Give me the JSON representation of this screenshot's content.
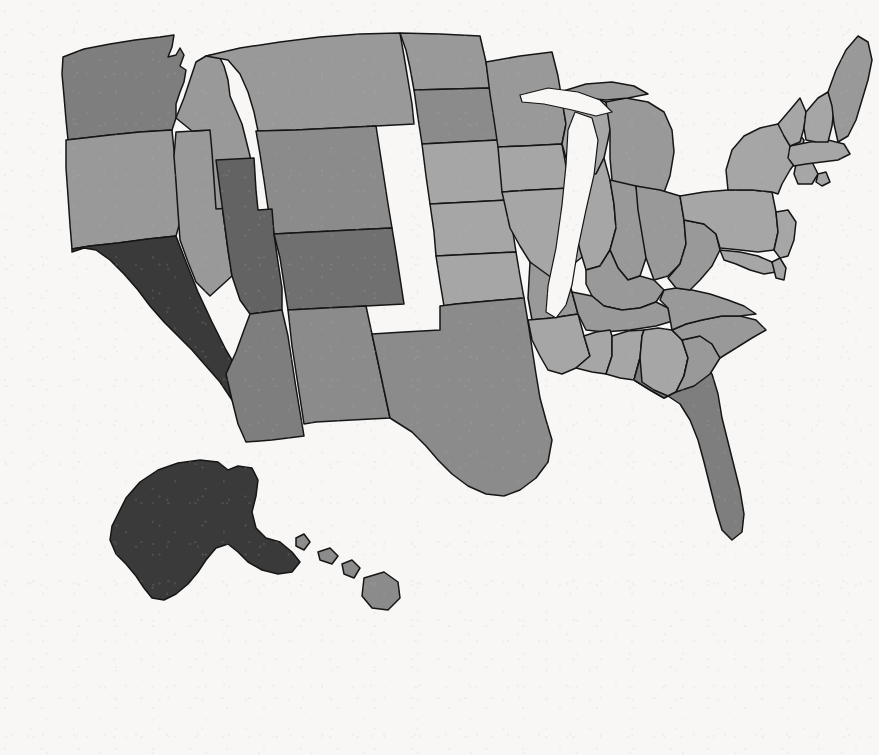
{
  "figure": {
    "type": "choropleth-map",
    "region": "United States",
    "background_color": "#f8f7f5",
    "border_color": "#151515"
  },
  "legend": {
    "label": "Number of national parks",
    "orientation": "horizontal",
    "tick_values": [
      "0",
      "2",
      "4",
      "6",
      "8"
    ],
    "vmin": 0,
    "vmax": 8,
    "color_low": "#a6a6a6",
    "color_high": "#3a3a3a",
    "colormap": "grayscale-sequential"
  },
  "chart_data": {
    "type": "heatmap",
    "title": "",
    "xlabel": "",
    "ylabel": "",
    "legend_title": "Number of national parks",
    "legend_position": "bottom-left",
    "grid": false,
    "value_range": [
      0,
      8
    ],
    "colormap_low": "#a6a6a6",
    "colormap_high": "#3a3a3a",
    "categories": [
      "Alabama",
      "Alaska",
      "Arizona",
      "Arkansas",
      "California",
      "Colorado",
      "Connecticut",
      "Delaware",
      "Florida",
      "Georgia",
      "Hawaii",
      "Idaho",
      "Illinois",
      "Indiana",
      "Iowa",
      "Kansas",
      "Kentucky",
      "Louisiana",
      "Maine",
      "Maryland",
      "Massachusetts",
      "Michigan",
      "Minnesota",
      "Mississippi",
      "Missouri",
      "Montana",
      "Nebraska",
      "Nevada",
      "New Hampshire",
      "New Jersey",
      "New Mexico",
      "New York",
      "North Carolina",
      "North Dakota",
      "Ohio",
      "Oklahoma",
      "Oregon",
      "Pennsylvania",
      "Rhode Island",
      "South Carolina",
      "South Dakota",
      "Tennessee",
      "Texas",
      "Utah",
      "Vermont",
      "Virginia",
      "Washington",
      "West Virginia",
      "Wisconsin",
      "Wyoming"
    ],
    "values": [
      0,
      8,
      3,
      1,
      9,
      4,
      0,
      0,
      3,
      0,
      2,
      1,
      0,
      1,
      0,
      0,
      1,
      0,
      1,
      0,
      0,
      1,
      1,
      0,
      0,
      1,
      0,
      1,
      0,
      0,
      2,
      0,
      1,
      1,
      1,
      0,
      1,
      0,
      0,
      1,
      2,
      1,
      2,
      5,
      0,
      1,
      3,
      1,
      0,
      2
    ],
    "state_values": [
      {
        "state": "California",
        "abbr": "CA",
        "value": 9
      },
      {
        "state": "Alaska",
        "abbr": "AK",
        "value": 8
      },
      {
        "state": "Utah",
        "abbr": "UT",
        "value": 5
      },
      {
        "state": "Colorado",
        "abbr": "CO",
        "value": 4
      },
      {
        "state": "Arizona",
        "abbr": "AZ",
        "value": 3
      },
      {
        "state": "Florida",
        "abbr": "FL",
        "value": 3
      },
      {
        "state": "Washington",
        "abbr": "WA",
        "value": 3
      },
      {
        "state": "Texas",
        "abbr": "TX",
        "value": 2
      },
      {
        "state": "Hawaii",
        "abbr": "HI",
        "value": 2
      },
      {
        "state": "New Mexico",
        "abbr": "NM",
        "value": 2
      },
      {
        "state": "South Dakota",
        "abbr": "SD",
        "value": 2
      },
      {
        "state": "Wyoming",
        "abbr": "WY",
        "value": 2
      },
      {
        "state": "Montana",
        "abbr": "MT",
        "value": 1
      },
      {
        "state": "Arkansas",
        "abbr": "AR",
        "value": 1
      },
      {
        "state": "Idaho",
        "abbr": "ID",
        "value": 1
      },
      {
        "state": "Indiana",
        "abbr": "IN",
        "value": 1
      },
      {
        "state": "Kentucky",
        "abbr": "KY",
        "value": 1
      },
      {
        "state": "Maine",
        "abbr": "ME",
        "value": 1
      },
      {
        "state": "Michigan",
        "abbr": "MI",
        "value": 1
      },
      {
        "state": "Minnesota",
        "abbr": "MN",
        "value": 1
      },
      {
        "state": "Nevada",
        "abbr": "NV",
        "value": 1
      },
      {
        "state": "North Carolina",
        "abbr": "NC",
        "value": 1
      },
      {
        "state": "North Dakota",
        "abbr": "ND",
        "value": 1
      },
      {
        "state": "Ohio",
        "abbr": "OH",
        "value": 1
      },
      {
        "state": "Oregon",
        "abbr": "OR",
        "value": 1
      },
      {
        "state": "South Carolina",
        "abbr": "SC",
        "value": 1
      },
      {
        "state": "Tennessee",
        "abbr": "TN",
        "value": 1
      },
      {
        "state": "Virginia",
        "abbr": "VA",
        "value": 1
      },
      {
        "state": "West Virginia",
        "abbr": "WV",
        "value": 1
      },
      {
        "state": "Alabama",
        "abbr": "AL",
        "value": 0
      },
      {
        "state": "Connecticut",
        "abbr": "CT",
        "value": 0
      },
      {
        "state": "Delaware",
        "abbr": "DE",
        "value": 0
      },
      {
        "state": "Georgia",
        "abbr": "GA",
        "value": 0
      },
      {
        "state": "Illinois",
        "abbr": "IL",
        "value": 0
      },
      {
        "state": "Iowa",
        "abbr": "IA",
        "value": 0
      },
      {
        "state": "Kansas",
        "abbr": "KS",
        "value": 0
      },
      {
        "state": "Louisiana",
        "abbr": "LA",
        "value": 0
      },
      {
        "state": "Maryland",
        "abbr": "MD",
        "value": 0
      },
      {
        "state": "Massachusetts",
        "abbr": "MA",
        "value": 0
      },
      {
        "state": "Mississippi",
        "abbr": "MS",
        "value": 0
      },
      {
        "state": "Missouri",
        "abbr": "MO",
        "value": 0
      },
      {
        "state": "Nebraska",
        "abbr": "NE",
        "value": 0
      },
      {
        "state": "New Hampshire",
        "abbr": "NH",
        "value": 0
      },
      {
        "state": "New Jersey",
        "abbr": "NJ",
        "value": 0
      },
      {
        "state": "New York",
        "abbr": "NY",
        "value": 0
      },
      {
        "state": "Oklahoma",
        "abbr": "OK",
        "value": 0
      },
      {
        "state": "Pennsylvania",
        "abbr": "PA",
        "value": 0
      },
      {
        "state": "Rhode Island",
        "abbr": "RI",
        "value": 0
      },
      {
        "state": "Vermont",
        "abbr": "VT",
        "value": 0
      },
      {
        "state": "Wisconsin",
        "abbr": "WI",
        "value": 0
      }
    ]
  }
}
